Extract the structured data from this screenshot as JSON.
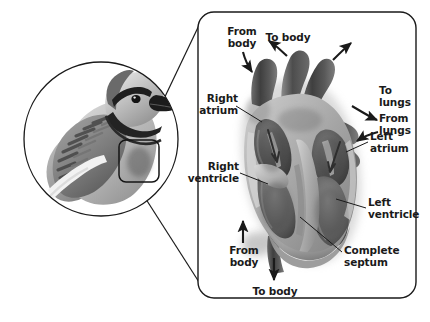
{
  "figure": {
    "background_color": "#ffffff",
    "line_color": "#1a1a1a",
    "text_color": "#1a1a1a"
  },
  "inset": {
    "name": "bird-inset",
    "description": "Grayscale blue jay in profile enclosed by a circle",
    "circle": {
      "cx": 101,
      "cy": 139,
      "r": 77
    },
    "marker": {
      "x": 119,
      "y": 140,
      "w": 40,
      "h": 42,
      "rx": 7
    }
  },
  "panel": {
    "name": "heart-detail-panel",
    "x": 198,
    "y": 12,
    "w": 218,
    "h": 286,
    "rx": 16
  },
  "connectors": [
    {
      "name": "connector-upper",
      "x1": 131,
      "y1": 168,
      "x2": 202,
      "y2": 20
    },
    {
      "name": "connector-lower",
      "x1": 119,
      "y1": 158,
      "x2": 205,
      "y2": 292
    }
  ],
  "labels": {
    "from_body_top": "From\nbody",
    "to_body_top": "To body",
    "to_lungs": "To\nlungs",
    "from_lungs": "From\nlungs",
    "right_atrium": "Right\natrium",
    "right_ventricle": "Right\nventricle",
    "left_atrium": "Left\natrium",
    "left_ventricle": "Left\nventricle",
    "complete_septum": "Complete\nseptum",
    "from_body_bottom": "From\nbody",
    "to_body_bottom": "To body"
  },
  "arrows": [
    {
      "name": "arrow-from-body-top",
      "direction": "down",
      "label": "From body"
    },
    {
      "name": "arrow-to-body-top-left",
      "direction": "up-left",
      "label": "To body"
    },
    {
      "name": "arrow-to-body-top-right",
      "direction": "up-right",
      "label": "To body"
    },
    {
      "name": "arrow-to-lungs",
      "direction": "right",
      "label": "To lungs"
    },
    {
      "name": "arrow-from-lungs",
      "direction": "left",
      "label": "From lungs"
    },
    {
      "name": "arrow-from-body-bottom",
      "direction": "up",
      "label": "From body"
    },
    {
      "name": "arrow-to-body-bottom",
      "direction": "down",
      "label": "To body"
    }
  ],
  "leaders": [
    {
      "name": "leader-right-atrium",
      "x1": 236,
      "y1": 106,
      "x2": 259,
      "y2": 120
    },
    {
      "name": "leader-right-ventricle",
      "x1": 239,
      "y1": 172,
      "x2": 266,
      "y2": 182
    },
    {
      "name": "leader-left-atrium",
      "x1": 345,
      "y1": 152,
      "x2": 366,
      "y2": 143
    },
    {
      "name": "leader-left-ventricle",
      "x1": 334,
      "y1": 198,
      "x2": 364,
      "y2": 207
    },
    {
      "name": "leader-complete-septum",
      "x1": 299,
      "y1": 218,
      "x2": 340,
      "y2": 252
    }
  ],
  "heart": {
    "name": "heart-illustration",
    "shading": "grayscale airbrush",
    "chambers": [
      "right atrium",
      "right ventricle",
      "left atrium",
      "left ventricle"
    ],
    "features": [
      "complete septum",
      "great vessels",
      "valves",
      "blood-flow arrows"
    ],
    "palette": {
      "outer_wall": "#9b9b9b",
      "wall_light": "#c4c4c4",
      "chamber_dark": "#4a4a4a",
      "chamber_mid": "#6d6d6d",
      "vessel_dark": "#3a3a3a",
      "highlight": "#d8d8d8",
      "shadow": "#2b2b2b"
    }
  }
}
